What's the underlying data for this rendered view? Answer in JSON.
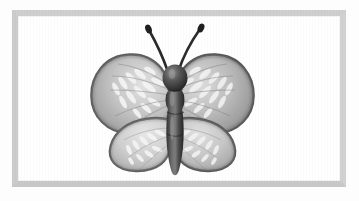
{
  "scene": {
    "title": "Butterfly Illustration",
    "subject": "butterfly",
    "style": "grayscale-clip-art",
    "canvas_width": 359,
    "canvas_height": 201,
    "page_background": "#fdfdfd"
  },
  "frame": {
    "name": "picture-frame-border",
    "left": 12,
    "top": 10,
    "width": 334,
    "height": 177,
    "border_thickness": 6,
    "border_color_top": "#cfcfcf",
    "border_color_left": "#cccccc",
    "border_color_right": "#d2d2d2",
    "border_color_bottom": "#c9c9c9",
    "inner_panel_color": "#ffffff",
    "inner_edge_color": "#f2f2f2"
  },
  "butterfly": {
    "name": "butterfly-figure",
    "bounds": {
      "left": 100,
      "top": 25,
      "width": 165,
      "height": 150
    },
    "parts": [
      {
        "name": "antenna-left",
        "label": "Left antenna"
      },
      {
        "name": "antenna-right",
        "label": "Right antenna"
      },
      {
        "name": "head",
        "label": "Head"
      },
      {
        "name": "thorax",
        "label": "Thorax"
      },
      {
        "name": "abdomen",
        "label": "Abdomen"
      },
      {
        "name": "forewing-left",
        "label": "Upper left wing"
      },
      {
        "name": "forewing-right",
        "label": "Upper right wing"
      },
      {
        "name": "hindwing-left",
        "label": "Lower left wing"
      },
      {
        "name": "hindwing-right",
        "label": "Lower right wing"
      }
    ],
    "colors": {
      "wing_fill_light": "#d8d8d8",
      "wing_fill_mid": "#b9b9b9",
      "wing_fill_dark": "#9a9a9a",
      "wing_outline": "#5f5f5f",
      "wing_outline_soft": "#7a7a7a",
      "body_dark": "#3a3a3a",
      "body_mid": "#545454",
      "body_highlight": "#8a8a8a",
      "antenna": "#2e2e2e",
      "marking_white": "#f4f4f4"
    },
    "markings": {
      "forewing_streak_count": 11,
      "hindwing_streak_count": 9,
      "description": "Radiating pale streaks fanning outward from the body across each wing"
    }
  }
}
